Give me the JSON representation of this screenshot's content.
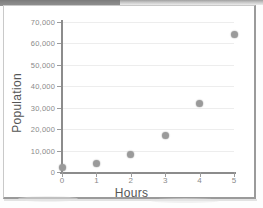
{
  "chart_data": {
    "type": "scatter",
    "title": "",
    "xlabel": "Hours",
    "ylabel": "Population",
    "x": [
      0,
      1,
      2,
      3,
      4,
      5
    ],
    "values": [
      2000,
      4000,
      8000,
      17000,
      32000,
      64000
    ],
    "series": [
      {
        "name": "Population",
        "points": [
          {
            "x": 0,
            "y": 2000
          },
          {
            "x": 1,
            "y": 4000
          },
          {
            "x": 2,
            "y": 8000
          },
          {
            "x": 3,
            "y": 17000
          },
          {
            "x": 4,
            "y": 32000
          },
          {
            "x": 5,
            "y": 64000
          }
        ]
      }
    ],
    "xlim": [
      0,
      5
    ],
    "ylim": [
      0,
      70000
    ],
    "xticks": [
      "0",
      "1",
      "2",
      "3",
      "4",
      "5"
    ],
    "yticks": [
      "0",
      "10,000",
      "20,000",
      "30,000",
      "40,000",
      "50,000",
      "60,000",
      "70,000"
    ],
    "ytick_values": [
      0,
      10000,
      20000,
      30000,
      40000,
      50000,
      60000,
      70000
    ],
    "grid": true,
    "grid_axis": "y",
    "legend": false,
    "marker_color": "#9a9a9a",
    "axis_color": "#8c8c8c",
    "grid_color": "#ededed",
    "tick_label_color": "#8a8a8a",
    "axis_title_color": "#555555"
  },
  "page": {
    "background": "#ffffff",
    "frame_color": "#c9c9c9"
  }
}
